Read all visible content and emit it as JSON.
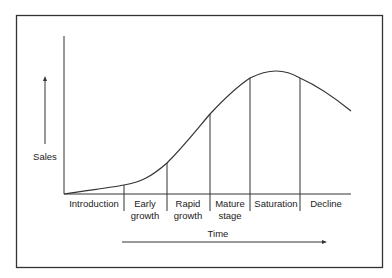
{
  "diagram": {
    "y_label": "Sales",
    "x_label": "Time",
    "stages": [
      {
        "line1": "Introduction",
        "line2": ""
      },
      {
        "line1": "Early",
        "line2": "growth"
      },
      {
        "line1": "Rapid",
        "line2": "growth"
      },
      {
        "line1": "Mature",
        "line2": "stage"
      },
      {
        "line1": "Saturation",
        "line2": ""
      },
      {
        "line1": "Decline",
        "line2": ""
      }
    ],
    "colors": {
      "line": "#333333",
      "background": "#ffffff"
    }
  }
}
